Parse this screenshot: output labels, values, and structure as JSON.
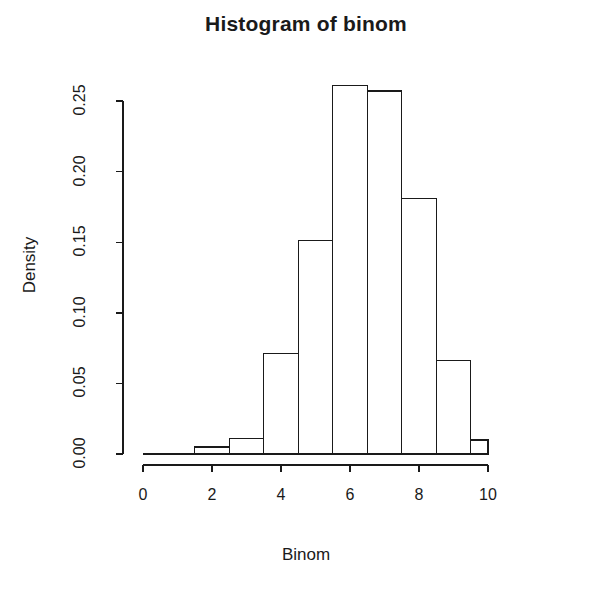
{
  "chart_data": {
    "type": "bar",
    "title": "Histogram of binom",
    "xlabel": "Binom",
    "ylabel": "Density",
    "grid": false,
    "legend": "none",
    "bin_width": 1,
    "bin_edges": [
      1.5,
      2.5,
      3.5,
      4.5,
      5.5,
      6.5,
      7.5,
      8.5,
      9.5,
      10.5
    ],
    "bin_centers": [
      2,
      3,
      4,
      5,
      6,
      7,
      8,
      9,
      10
    ],
    "categories": [
      "1.5-2.5",
      "2.5-3.5",
      "3.5-4.5",
      "4.5-5.5",
      "5.5-6.5",
      "6.5-7.5",
      "7.5-8.5",
      "8.5-9.5",
      "9.5-10.5"
    ],
    "values": [
      0.005,
      0.011,
      0.071,
      0.151,
      0.261,
      0.257,
      0.181,
      0.066,
      0.01
    ],
    "xlim": [
      0,
      10.5
    ],
    "ylim": [
      0.0,
      0.26
    ],
    "x_ticks": [
      0,
      2,
      4,
      6,
      8,
      10
    ],
    "x_tick_labels": [
      "0",
      "2",
      "4",
      "6",
      "8",
      "10"
    ],
    "y_ticks": [
      0.0,
      0.05,
      0.1,
      0.15,
      0.2,
      0.25
    ],
    "y_tick_labels": [
      "0.00",
      "0.05",
      "0.10",
      "0.15",
      "0.20",
      "0.25"
    ],
    "x_axis_range_drawn": [
      0,
      10
    ],
    "y_axis_range_drawn": [
      0.0,
      0.25
    ]
  }
}
